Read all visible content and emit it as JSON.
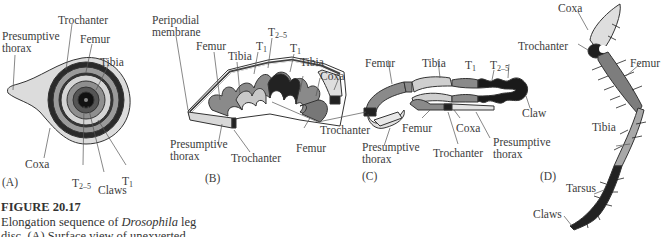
{
  "figure": {
    "number": "FIGURE 20.17",
    "caption_lines": [
      {
        "before": "Elongation sequence of ",
        "italic": "Drosophila",
        "after": " leg"
      },
      {
        "before": "disc. (A) Surface view of unexverted",
        "italic": "",
        "after": ""
      }
    ]
  },
  "panels": {
    "A": {
      "tag": "(A)",
      "labels": {
        "presumptive_thorax_1": "Presumptive",
        "presumptive_thorax_2": "thorax",
        "trochanter": "Trochanter",
        "femur": "Femur",
        "tibia": "Tibia",
        "coxa": "Coxa",
        "t25": "T",
        "t25_sub": "2–5",
        "claws": "Claws",
        "t1": "T",
        "t1_sub": "1"
      }
    },
    "B": {
      "tag": "(B)",
      "labels": {
        "peripodial_1": "Peripodial",
        "peripodial_2": "membrane",
        "femur": "Femur",
        "tibia": "Tibia",
        "t1a": "T",
        "t1a_sub": "1",
        "t25": "T",
        "t25_sub": "2–5",
        "t1b": "T",
        "t1b_sub": "1",
        "tibia2": "Tibia",
        "coxa": "Coxa",
        "presumptive_thorax_1": "Presumptive",
        "presumptive_thorax_2": "thorax",
        "trochanter": "Trochanter",
        "femur2": "Femur"
      }
    },
    "C": {
      "tag": "(C)",
      "labels": {
        "trochanter": "Trochanter",
        "femur": "Femur",
        "tibia": "Tibia",
        "t1": "T",
        "t1_sub": "1",
        "t25": "T",
        "t25_sub": "2–5",
        "claw": "Claw",
        "presumptive_thorax_1": "Presumptive",
        "presumptive_thorax_2": "thorax",
        "femur2": "Femur",
        "coxa": "Coxa",
        "trochanter2": "Trochanter",
        "presumptive_thorax2_1": "Presumptive",
        "presumptive_thorax2_2": "thorax"
      }
    },
    "D": {
      "tag": "(D)",
      "labels": {
        "coxa": "Coxa",
        "trochanter": "Trochanter",
        "femur": "Femur",
        "tibia": "Tibia",
        "tarsus": "Tarsus",
        "claws": "Claws"
      }
    }
  },
  "colors": {
    "outline": "#333333",
    "light": "#d9d9d9",
    "mid": "#9a9a9a",
    "dark": "#6e6e6e",
    "black": "#1e1e1e"
  }
}
